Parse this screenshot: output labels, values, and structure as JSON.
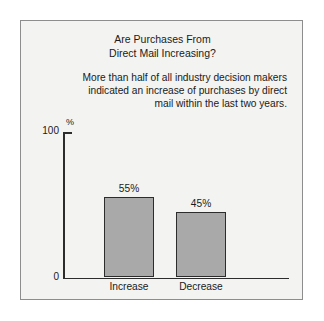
{
  "chart_data": {
    "type": "bar",
    "title": "Are Purchases From Direct Mail Increasing?",
    "title_lines": [
      "Are Purchases From",
      "Direct Mail Increasing?"
    ],
    "subtitle": "More than half of all industry decision makers indicated an increase of purchases by direct mail within the last two years.",
    "subtitle_lines": [
      "More than half of all industry decision makers",
      "indicated an increase of purchases by direct",
      "mail within the last two years."
    ],
    "categories": [
      "Increase",
      "Decrease"
    ],
    "values": [
      55,
      45
    ],
    "value_labels": [
      "55%",
      "45%"
    ],
    "xlabel": "",
    "ylabel": "%",
    "ylim": [
      0,
      100
    ],
    "ytick_labels": [
      "0",
      "100"
    ],
    "grid": false,
    "legend": false,
    "colors": {
      "bar_fill": "#a9a9a9",
      "bar_edge": "#2c2c2c",
      "axis": "#2c2c2c",
      "text": "#1a1a1a",
      "panel_background": "#f3f3f1",
      "page_background": "#ffffff",
      "border": "#8d8d8d"
    }
  }
}
